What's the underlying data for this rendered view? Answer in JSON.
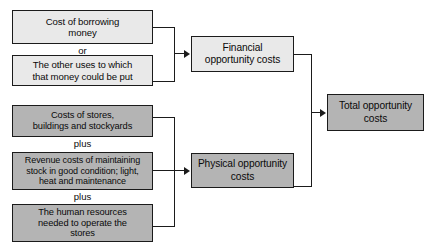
{
  "diagram": {
    "colors": {
      "box_light_fill": "#e9e9e9",
      "box_dark_fill": "#b4b4b4",
      "border": "#1b1b1b",
      "text": "#0a0a0a",
      "background": "#ffffff"
    },
    "nodes": [
      {
        "id": "cost-of-borrowing-money",
        "lines": [
          "Cost of borrowing",
          "money"
        ],
        "shade": "light",
        "font_size": 9.6
      },
      {
        "id": "other-uses-of-money",
        "lines": [
          "The other uses to which",
          "that money could be put"
        ],
        "shade": "light",
        "font_size": 9.6
      },
      {
        "id": "costs-of-stores-buildings-stockyards",
        "lines": [
          "Costs of stores,",
          "buildings and stockyards"
        ],
        "shade": "dark",
        "font_size": 9.3
      },
      {
        "id": "revenue-costs-of-maintaining-stock",
        "lines": [
          "Revenue costs of maintaining",
          "stock in good condition; light,",
          "heat and maintenance"
        ],
        "shade": "dark",
        "font_size": 9.0
      },
      {
        "id": "human-resources-to-operate-stores",
        "lines": [
          "The human resources",
          "needed to operate the",
          "stores"
        ],
        "shade": "dark",
        "font_size": 9.3
      },
      {
        "id": "financial-opportunity-costs",
        "lines": [
          "Financial",
          "opportunity costs"
        ],
        "shade": "light",
        "font_size": 10.2
      },
      {
        "id": "physical-opportunity-costs",
        "lines": [
          "Physical opportunity",
          "costs"
        ],
        "shade": "dark",
        "font_size": 10.2
      },
      {
        "id": "total-opportunity-costs",
        "lines": [
          "Total opportunity",
          "costs"
        ],
        "shade": "dark",
        "font_size": 10.2
      }
    ],
    "connector_labels": [
      {
        "id": "or-label-financial",
        "text": "or"
      },
      {
        "id": "plus-label-stores",
        "text": "plus"
      },
      {
        "id": "plus-label-revenue",
        "text": "plus"
      }
    ]
  }
}
